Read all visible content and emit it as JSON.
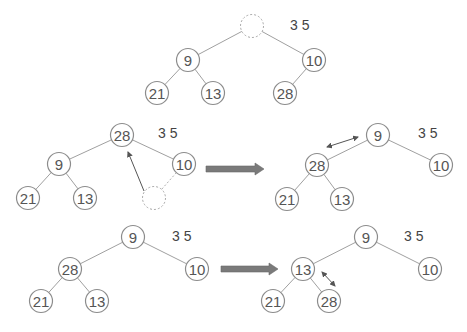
{
  "header": {
    "cropped_text_visible": true
  },
  "colors": {
    "node_stroke": "#8c8c8c",
    "edge": "#a0a0a0",
    "big_arrow": "#7a7a7a",
    "text": "#555555"
  },
  "diagrams": [
    {
      "id": "step1",
      "side_label": "3 5",
      "side_label_pos": [
        290,
        30
      ],
      "nodes": [
        {
          "id": "root",
          "label": "",
          "x": 252,
          "y": 26,
          "empty": true
        },
        {
          "id": "n9",
          "label": "9",
          "x": 188,
          "y": 60
        },
        {
          "id": "n10",
          "label": "10",
          "x": 314,
          "y": 60
        },
        {
          "id": "n21",
          "label": "21",
          "x": 157,
          "y": 93
        },
        {
          "id": "n13",
          "label": "13",
          "x": 213,
          "y": 93
        },
        {
          "id": "n28",
          "label": "28",
          "x": 285,
          "y": 93
        }
      ],
      "edges": [
        [
          "root",
          "n9"
        ],
        [
          "root",
          "n10"
        ],
        [
          "n9",
          "n21"
        ],
        [
          "n9",
          "n13"
        ],
        [
          "n10",
          "n28"
        ]
      ]
    },
    {
      "id": "step2-before",
      "side_label": "3 5",
      "side_label_pos": [
        158,
        138
      ],
      "nodes": [
        {
          "id": "n28",
          "label": "28",
          "x": 122,
          "y": 135
        },
        {
          "id": "n9",
          "label": "9",
          "x": 59,
          "y": 164
        },
        {
          "id": "n10",
          "label": "10",
          "x": 184,
          "y": 164
        },
        {
          "id": "n21",
          "label": "21",
          "x": 28,
          "y": 198
        },
        {
          "id": "n13",
          "label": "13",
          "x": 85,
          "y": 198
        },
        {
          "id": "empty",
          "label": "",
          "x": 154,
          "y": 198,
          "empty": true
        }
      ],
      "edges": [
        [
          "n28",
          "n9"
        ],
        [
          "n28",
          "n10"
        ],
        [
          "n9",
          "n21"
        ],
        [
          "n9",
          "n13"
        ]
      ],
      "dashed_edges": [
        [
          "n10",
          "empty"
        ]
      ],
      "move_arrow": {
        "from": [
          144,
          191
        ],
        "to": [
          128,
          152
        ],
        "type": "single"
      }
    },
    {
      "id": "step2-after",
      "side_label": "3 5",
      "side_label_pos": [
        418,
        138
      ],
      "nodes": [
        {
          "id": "n9",
          "label": "9",
          "x": 378,
          "y": 135
        },
        {
          "id": "n28",
          "label": "28",
          "x": 317,
          "y": 165
        },
        {
          "id": "n10",
          "label": "10",
          "x": 441,
          "y": 165
        },
        {
          "id": "n21",
          "label": "21",
          "x": 287,
          "y": 199
        },
        {
          "id": "n13",
          "label": "13",
          "x": 342,
          "y": 199
        }
      ],
      "edges": [
        [
          "n9",
          "n28"
        ],
        [
          "n9",
          "n10"
        ],
        [
          "n28",
          "n21"
        ],
        [
          "n28",
          "n13"
        ]
      ],
      "swap_arrow": {
        "from": [
          327,
          147
        ],
        "to": [
          358,
          137
        ],
        "type": "double"
      }
    },
    {
      "id": "step3-before",
      "side_label": "3 5",
      "side_label_pos": [
        172,
        241
      ],
      "nodes": [
        {
          "id": "n9",
          "label": "9",
          "x": 133,
          "y": 237
        },
        {
          "id": "n28",
          "label": "28",
          "x": 70,
          "y": 269
        },
        {
          "id": "n10",
          "label": "10",
          "x": 197,
          "y": 269
        },
        {
          "id": "n21",
          "label": "21",
          "x": 41,
          "y": 301
        },
        {
          "id": "n13",
          "label": "13",
          "x": 97,
          "y": 301
        }
      ],
      "edges": [
        [
          "n9",
          "n28"
        ],
        [
          "n9",
          "n10"
        ],
        [
          "n28",
          "n21"
        ],
        [
          "n28",
          "n13"
        ]
      ]
    },
    {
      "id": "step3-after",
      "side_label": "3 5",
      "side_label_pos": [
        404,
        241
      ],
      "nodes": [
        {
          "id": "n9",
          "label": "9",
          "x": 366,
          "y": 237
        },
        {
          "id": "n13",
          "label": "13",
          "x": 303,
          "y": 269
        },
        {
          "id": "n10",
          "label": "10",
          "x": 430,
          "y": 269
        },
        {
          "id": "n21",
          "label": "21",
          "x": 273,
          "y": 301
        },
        {
          "id": "n28",
          "label": "28",
          "x": 329,
          "y": 301
        }
      ],
      "edges": [
        [
          "n9",
          "n13"
        ],
        [
          "n9",
          "n10"
        ],
        [
          "n13",
          "n21"
        ],
        [
          "n13",
          "n28"
        ]
      ],
      "swap_arrow": {
        "from": [
          322,
          272
        ],
        "to": [
          335,
          286
        ],
        "type": "double"
      }
    }
  ],
  "transition_arrows": [
    {
      "id": "arrow-step2",
      "x1": 206,
      "x2": 264,
      "y": 169
    },
    {
      "id": "arrow-step3",
      "x1": 221,
      "x2": 278,
      "y": 269
    }
  ]
}
